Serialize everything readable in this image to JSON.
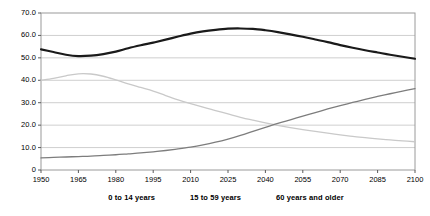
{
  "chart_data": {
    "type": "line",
    "title": "",
    "subtitle": "",
    "xlabel": "",
    "ylabel": "",
    "xlim": [
      1950,
      2100
    ],
    "ylim": [
      0,
      70
    ],
    "grid": true,
    "legend_position": "bottom",
    "x_ticks": [
      "1950",
      "1965",
      "1980",
      "1995",
      "2010",
      "2025",
      "2040",
      "2055",
      "2070",
      "2085",
      "2100"
    ],
    "y_ticks": [
      "0",
      "10.0",
      "20.0",
      "30.0",
      "40.0",
      "50.0",
      "60.0",
      "70.0"
    ],
    "x": [
      1950,
      1955,
      1960,
      1965,
      1970,
      1975,
      1980,
      1985,
      1990,
      1995,
      2000,
      2005,
      2010,
      2015,
      2020,
      2025,
      2030,
      2035,
      2040,
      2045,
      2050,
      2055,
      2060,
      2065,
      2070,
      2075,
      2080,
      2085,
      2090,
      2095,
      2100
    ],
    "series": [
      {
        "name": "0 to 14 years",
        "color": "#c9c9c9",
        "width": 1.3,
        "values": [
          40.0,
          40.9,
          42.0,
          42.9,
          42.8,
          41.8,
          40.2,
          38.4,
          36.8,
          35.2,
          33.2,
          31.3,
          29.6,
          28.0,
          26.5,
          25.0,
          23.5,
          22.2,
          21.0,
          19.9,
          18.9,
          18.0,
          17.2,
          16.4,
          15.7,
          15.0,
          14.4,
          13.9,
          13.4,
          13.0,
          12.6
        ]
      },
      {
        "name": "15 to 59 years",
        "color": "#1a1a1a",
        "width": 2.2,
        "values": [
          53.8,
          52.6,
          51.4,
          50.8,
          51.0,
          51.7,
          52.8,
          54.3,
          55.6,
          56.8,
          58.1,
          59.5,
          60.8,
          61.8,
          62.5,
          63.0,
          63.1,
          62.9,
          62.3,
          61.5,
          60.5,
          59.4,
          58.2,
          57.0,
          55.7,
          54.5,
          53.4,
          52.4,
          51.4,
          50.5,
          49.6
        ]
      },
      {
        "name": "60 years and older",
        "color": "#7d7d7d",
        "width": 1.3,
        "values": [
          5.4,
          5.6,
          5.8,
          6.0,
          6.2,
          6.5,
          6.8,
          7.2,
          7.6,
          8.1,
          8.7,
          9.4,
          10.2,
          11.2,
          12.4,
          13.8,
          15.4,
          17.2,
          19.0,
          20.8,
          22.4,
          24.0,
          25.6,
          27.2,
          28.7,
          30.1,
          31.5,
          32.8,
          34.0,
          35.2,
          36.3
        ]
      }
    ]
  },
  "legend": {
    "items": [
      {
        "label": "0 to 14 years"
      },
      {
        "label": "15 to 59 years"
      },
      {
        "label": "60 years and older"
      }
    ]
  }
}
